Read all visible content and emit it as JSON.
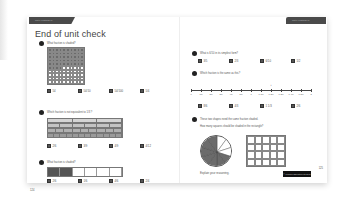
{
  "left_page": {
    "tab_label": "Unit 9: Fractions (1)",
    "title": "End of unit check",
    "page_number": "124",
    "questions": [
      {
        "number": "1",
        "text": "What fraction is shaded?",
        "figure": {
          "type": "hundred-grid",
          "rows": 10,
          "cols": 10,
          "shaded": 54
        },
        "options": [
          {
            "label": "A",
            "value": "54"
          },
          {
            "label": "B",
            "value": "54/10"
          },
          {
            "label": "C",
            "value": "54/100"
          },
          {
            "label": "D",
            "value": "5/4"
          }
        ]
      },
      {
        "number": "2",
        "text": "Which fraction is not equivalent to 1/3 ?",
        "figure": {
          "type": "fraction-wall",
          "rows": [
            3,
            6,
            9,
            12
          ]
        },
        "options": [
          {
            "label": "A",
            "value": "2/6"
          },
          {
            "label": "B",
            "value": "3/9"
          },
          {
            "label": "C",
            "value": "4/9"
          },
          {
            "label": "D",
            "value": "4/12"
          }
        ]
      },
      {
        "number": "3",
        "text": "What fraction is shaded?",
        "figure": {
          "type": "strip",
          "parts": 6,
          "shaded": 2
        },
        "options": [
          {
            "label": "A",
            "value": "2/6"
          },
          {
            "label": "B",
            "value": "1/6"
          },
          {
            "label": "C",
            "value": "4/6"
          },
          {
            "label": "D",
            "value": "2/4"
          }
        ]
      }
    ]
  },
  "right_page": {
    "tab_label": "Unit 9: Fractions (1)",
    "page_number": "125",
    "footer_badge": "© Pearson Education Ltd 2017",
    "questions": [
      {
        "number": "4",
        "text": "What is 6/10 in its simplest form?",
        "options": [
          {
            "label": "A",
            "value": "3/5"
          },
          {
            "label": "B",
            "value": "2/3"
          },
          {
            "label": "C",
            "value": "6/10"
          },
          {
            "label": "D",
            "value": "1/2"
          }
        ]
      },
      {
        "number": "5",
        "text": "Which fraction is the same as this?",
        "figure": {
          "type": "number-line",
          "labels": [
            "0",
            "1/6",
            "2/6",
            "3/6",
            "4/6",
            "5/6",
            "1",
            "1 1/6",
            "1 2/6",
            "1 3/6",
            "1 4/6",
            "1 5/6",
            "2"
          ],
          "arrow_at_index": 8
        },
        "options": [
          {
            "label": "A",
            "value": "8/6"
          },
          {
            "label": "B",
            "value": "4/3"
          },
          {
            "label": "C",
            "value": "1 1/3"
          },
          {
            "label": "D",
            "value": "2/6"
          }
        ]
      },
      {
        "number": "6",
        "text": "These two shapes need the same fraction shaded.",
        "subtext": "How many squares should be shaded in the rectangle?",
        "figure": {
          "pie_slices": 10,
          "pie_shaded": 7,
          "rect_rows": 4,
          "rect_cols": 5
        },
        "prompt": "Explain your reasoning."
      }
    ]
  }
}
